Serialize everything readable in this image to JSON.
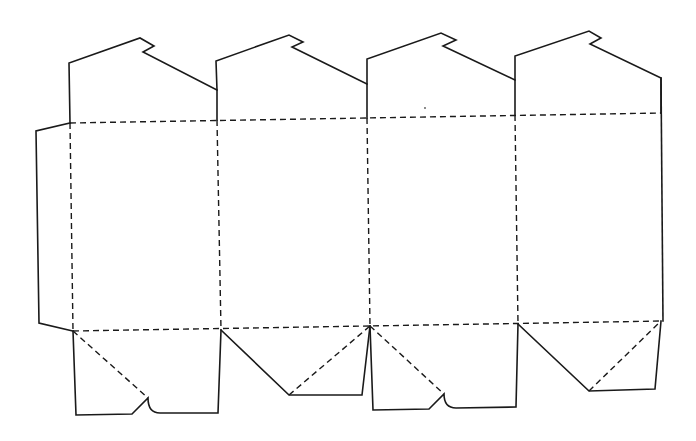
{
  "diagram": {
    "type": "box-net-template",
    "colors": {
      "background": "#ffffff",
      "line": "#1a1a1a"
    },
    "legend": {
      "cut_line": "solid",
      "fold_line": "dashed"
    },
    "panels": [
      {
        "name": "panel-1",
        "label": ""
      },
      {
        "name": "panel-2",
        "label": ""
      },
      {
        "name": "panel-3",
        "label": ""
      },
      {
        "name": "panel-4",
        "label": ""
      }
    ],
    "cut_paths": [
      {
        "name": "glue-flap-outline",
        "d": "M70,123 L36,131 L39,323 L73,331"
      },
      {
        "name": "top-flap-1-outline",
        "d": "M70,123 L69,63 L140,38 L154,46 L143,52 L217,90 L217,120"
      },
      {
        "name": "top-flap-2-outline",
        "d": "M217,90 L216,61 L289,35 L303,42 L292,47 L367,84 L367,118"
      },
      {
        "name": "top-flap-3-outline",
        "d": "M367,84 L367,59 L441,33 L456,40 L443,46 L515,80 L515,115"
      },
      {
        "name": "top-flap-4-outline",
        "d": "M515,80 L515,56 L589,31 L601,38 L590,44 L661,78 L661,113"
      },
      {
        "name": "right-edge",
        "d": "M661,78 L663,321"
      },
      {
        "name": "bottom-flap-1-outline",
        "d": "M73,331 L76,415 L132,414 L148,398 C148,408 152,413 160,413 L218,413 L221,330"
      },
      {
        "name": "bottom-flap-2-outline",
        "d": "M221,330 L289,395 L362,395 L370,326"
      },
      {
        "name": "bottom-flap-3-outline",
        "d": "M370,326 L373,410 L429,409 L444,394 C444,403 448,408 456,408 L516,407 L518,324"
      },
      {
        "name": "bottom-flap-4-outline",
        "d": "M518,324 L589,391 L655,389 L661,321"
      }
    ],
    "fold_paths": [
      {
        "name": "top-fold-line",
        "d": "M70,123 L661,113"
      },
      {
        "name": "bottom-fold-line",
        "d": "M73,331 L663,321"
      },
      {
        "name": "panel-fold-1",
        "d": "M70,123 L73,331"
      },
      {
        "name": "panel-fold-2",
        "d": "M217,120 L221,330"
      },
      {
        "name": "panel-fold-3",
        "d": "M367,118 L370,326"
      },
      {
        "name": "panel-fold-4",
        "d": "M515,115 L518,324"
      },
      {
        "name": "bottom-diagonal-1",
        "d": "M73,331 L148,398"
      },
      {
        "name": "bottom-diagonal-2",
        "d": "M289,395 L370,326"
      },
      {
        "name": "bottom-diagonal-3",
        "d": "M370,326 L444,394"
      },
      {
        "name": "bottom-diagonal-4",
        "d": "M589,391 L661,321"
      }
    ]
  }
}
